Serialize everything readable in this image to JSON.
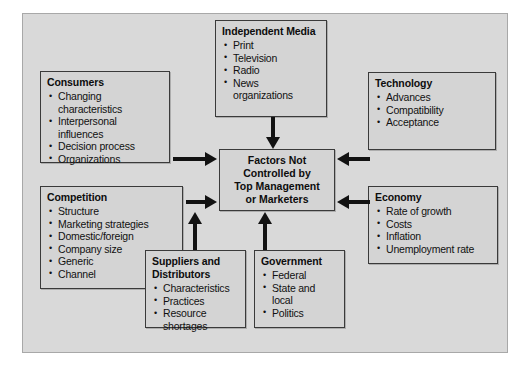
{
  "diagram": {
    "title": "Factors Not Controlled by Top Management or Marketers",
    "center": {
      "lines": [
        "Factors Not",
        "Controlled by",
        "Top Management",
        "or Marketers"
      ]
    },
    "nodes": [
      {
        "id": "consumers",
        "title": "Consumers",
        "items": [
          {
            "text": "Changing",
            "continuation": false
          },
          {
            "text": "characteristics",
            "continuation": true
          },
          {
            "text": "Interpersonal",
            "continuation": false
          },
          {
            "text": "influences",
            "continuation": true
          },
          {
            "text": "Decision process",
            "continuation": false
          },
          {
            "text": "Organizations",
            "continuation": false
          }
        ]
      },
      {
        "id": "competition",
        "title": "Competition",
        "items": [
          {
            "text": "Structure",
            "continuation": false
          },
          {
            "text": "Marketing strategies",
            "continuation": false
          },
          {
            "text": "Domestic/foreign",
            "continuation": false
          },
          {
            "text": "Company size",
            "continuation": false
          },
          {
            "text": "Generic",
            "continuation": false
          },
          {
            "text": "Channel",
            "continuation": false
          }
        ]
      },
      {
        "id": "media",
        "title": "Independent Media",
        "items": [
          {
            "text": "Print",
            "continuation": false
          },
          {
            "text": "Television",
            "continuation": false
          },
          {
            "text": "Radio",
            "continuation": false
          },
          {
            "text": "News",
            "continuation": false
          },
          {
            "text": "organizations",
            "continuation": true
          }
        ]
      },
      {
        "id": "technology",
        "title": "Technology",
        "items": [
          {
            "text": "Advances",
            "continuation": false
          },
          {
            "text": "Compatibility",
            "continuation": false
          },
          {
            "text": "Acceptance",
            "continuation": false
          }
        ]
      },
      {
        "id": "economy",
        "title": "Economy",
        "items": [
          {
            "text": "Rate of growth",
            "continuation": false
          },
          {
            "text": "Costs",
            "continuation": false
          },
          {
            "text": "Inflation",
            "continuation": false
          },
          {
            "text": "Unemployment rate",
            "continuation": false
          }
        ]
      },
      {
        "id": "suppliers",
        "title": "Suppliers and Distributors",
        "items": [
          {
            "text": "Characteristics",
            "continuation": false
          },
          {
            "text": "Practices",
            "continuation": false
          },
          {
            "text": "Resource",
            "continuation": false
          },
          {
            "text": "shortages",
            "continuation": true
          }
        ]
      },
      {
        "id": "government",
        "title": "Government",
        "items": [
          {
            "text": "Federal",
            "continuation": false
          },
          {
            "text": "State and",
            "continuation": false
          },
          {
            "text": "local",
            "continuation": true
          },
          {
            "text": "Politics",
            "continuation": false
          }
        ]
      }
    ],
    "arrows": [
      {
        "id": "consumers-center",
        "from": "consumers",
        "to": "center",
        "direction": "right"
      },
      {
        "id": "competition-center",
        "from": "competition",
        "to": "center",
        "direction": "right"
      },
      {
        "id": "technology-center",
        "from": "technology",
        "to": "center",
        "direction": "left"
      },
      {
        "id": "economy-center",
        "from": "economy",
        "to": "center",
        "direction": "left"
      },
      {
        "id": "media-center",
        "from": "media",
        "to": "center",
        "direction": "down"
      },
      {
        "id": "suppliers-center",
        "from": "suppliers",
        "to": "center",
        "direction": "up"
      },
      {
        "id": "government-center",
        "from": "government",
        "to": "center",
        "direction": "up"
      }
    ],
    "colors": {
      "canvas_background": "#d9d9d9",
      "node_fill": "#d4d4d4",
      "node_border": "#3a3a3a",
      "arrow": "#121212",
      "text": "#111111"
    }
  }
}
